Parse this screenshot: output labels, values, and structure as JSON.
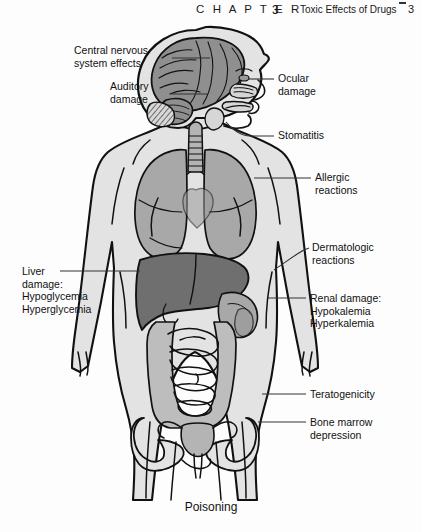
{
  "header": {
    "chapter_word": "C H A P T E R",
    "chapter_number": "3",
    "title": "Toxic Effects of Drugs",
    "page_number": "3"
  },
  "figure": {
    "caption": "Poisoning",
    "body_fill": "#e3e3e3",
    "organ_fill": "#a8a8a8",
    "liver_fill": "#6f6f6f",
    "brain_fill": "#8f8f8f",
    "outline": "#111111",
    "background": "#fdfdfd",
    "labels": [
      {
        "name": "central-nervous-system-effects",
        "side": "left",
        "line1": "Central nervous",
        "line2": "system effects",
        "line3": "",
        "x": 74,
        "y": 22
      },
      {
        "name": "auditory-damage",
        "side": "left",
        "line1": "Auditory",
        "line2": "damage",
        "line3": "",
        "x": 110,
        "y": 58
      },
      {
        "name": "ocular-damage",
        "side": "right",
        "line1": "Ocular",
        "line2": "damage",
        "line3": "",
        "x": 278,
        "y": 59
      },
      {
        "name": "stomatitis",
        "side": "right",
        "line1": "Stomatitis",
        "line2": "",
        "line3": "",
        "x": 278,
        "y": 111
      },
      {
        "name": "allergic-reactions",
        "side": "right",
        "line1": "Allergic",
        "line2": "reactions",
        "line3": "",
        "x": 315,
        "y": 150
      },
      {
        "name": "dermatologic-reactions",
        "side": "right",
        "line1": "Dermatologic",
        "line2": "reactions",
        "line3": "",
        "x": 312,
        "y": 218
      },
      {
        "name": "liver-damage",
        "side": "left",
        "line1": "Liver",
        "line2": "damage:",
        "line3": "Hypoglycemia",
        "line4": "Hyperglycemia",
        "x": 22,
        "y": 243
      },
      {
        "name": "renal-damage",
        "side": "right",
        "line1": "Renal damage:",
        "line2": "Hypokalemia",
        "line3": "Hyperkalemia",
        "x": 310,
        "y": 270
      },
      {
        "name": "teratogenicity",
        "side": "right",
        "line1": "Teratogenicity",
        "line2": "",
        "line3": "",
        "x": 310,
        "y": 366
      },
      {
        "name": "bone-marrow-depression",
        "side": "right",
        "line1": "Bone marrow",
        "line2": "depression",
        "line3": "",
        "x": 310,
        "y": 394
      }
    ],
    "anatomy_parts": [
      "brain",
      "cerebellum",
      "inner-ear",
      "eye",
      "nasal-passage",
      "oral-cavity",
      "trachea",
      "lungs",
      "liver",
      "stomach",
      "small-intestine",
      "large-intestine",
      "pelvis",
      "uterus",
      "kidney"
    ]
  }
}
